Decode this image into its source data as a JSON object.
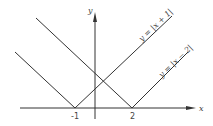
{
  "diagram": {
    "axes": {
      "x_label": "x",
      "y_label": "y"
    },
    "ticks": [
      {
        "value": -1,
        "label": "-1"
      },
      {
        "value": 2,
        "label": "2"
      }
    ],
    "curves": [
      {
        "label": "y = |x + 1|",
        "vertex": [
          -1,
          0
        ]
      },
      {
        "label": "y = |x − 2|",
        "vertex": [
          2,
          0
        ]
      }
    ],
    "colors": {
      "line": "#333333",
      "background": "#ffffff"
    }
  }
}
